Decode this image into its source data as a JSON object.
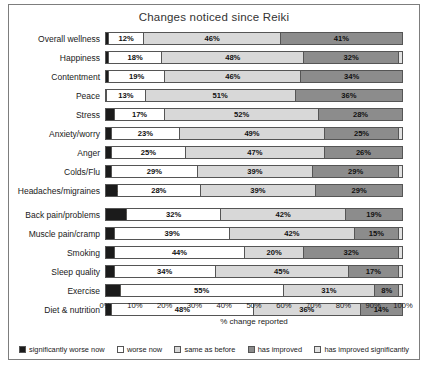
{
  "chart_data": {
    "type": "bar",
    "orientation": "horizontal",
    "stacked": true,
    "title": "Changes noticed since Reiki",
    "xlabel": "% change reported",
    "ylabel": "",
    "xlim": [
      0,
      100
    ],
    "xticks": [
      "0%",
      "10%",
      "20%",
      "30%",
      "40%",
      "50%",
      "60%",
      "70%",
      "80%",
      "90%",
      "100%"
    ],
    "grid": false,
    "legend_position": "bottom",
    "categories": [
      "Overall wellness",
      "Happiness",
      "Contentment",
      "Peace",
      "Stress",
      "Anxiety/worry",
      "Anger",
      "Colds/Flu",
      "Headaches/migraines",
      "Back pain/problems",
      "Muscle pain/cramp",
      "Smoking",
      "Sleep quality",
      "Exercise",
      "Diet & nutrition"
    ],
    "group_breaks_after": [
      "Headaches/migraines"
    ],
    "series": [
      {
        "name": "significantly worse now",
        "color": "#1b1b1b",
        "values": [
          1,
          1,
          1,
          0.4,
          3,
          2,
          2,
          2,
          4,
          7,
          3,
          3,
          3,
          5,
          2
        ],
        "labels": [
          "1%",
          "1%",
          "1%",
          "0.4%",
          "3%",
          "2%",
          "2%",
          "2%",
          "4%",
          "7%",
          "3%",
          "3%",
          "3%",
          "5%",
          "2%"
        ]
      },
      {
        "name": "worse now",
        "color": "#ffffff",
        "values": [
          12,
          18,
          19,
          13,
          17,
          23,
          25,
          29,
          28,
          32,
          39,
          44,
          34,
          55,
          48
        ],
        "labels": [
          "12%",
          "18%",
          "19%",
          "13%",
          "17%",
          "23%",
          "25%",
          "29%",
          "28%",
          "32%",
          "39%",
          "44%",
          "34%",
          "55%",
          "48%"
        ]
      },
      {
        "name": "same as before",
        "color": "#d8d8d8",
        "values": [
          46,
          48,
          46,
          51,
          52,
          49,
          47,
          39,
          39,
          42,
          42,
          20,
          45,
          31,
          36
        ],
        "labels": [
          "46%",
          "48%",
          "46%",
          "51%",
          "52%",
          "49%",
          "47%",
          "39%",
          "39%",
          "42%",
          "42%",
          "20%",
          "45%",
          "31%",
          "36%"
        ]
      },
      {
        "name": "has improved",
        "color": "#8c8c8c",
        "values": [
          41,
          32,
          34,
          36,
          28,
          25,
          26,
          29,
          29,
          19,
          15,
          32,
          17,
          8,
          14
        ],
        "labels": [
          "41%",
          "32%",
          "34%",
          "36%",
          "28%",
          "25%",
          "26%",
          "29%",
          "29%",
          "19%",
          "15%",
          "32%",
          "17%",
          "8%",
          "14%"
        ]
      },
      {
        "name": "has improved significantly",
        "color": "#e2e2e2",
        "values": [
          0,
          1,
          0,
          0,
          0,
          1,
          0,
          1,
          0,
          0,
          1,
          1,
          1,
          1,
          0
        ],
        "labels": [
          "",
          "",
          "",
          "",
          "",
          "",
          "",
          "",
          "",
          "",
          "",
          "",
          "",
          "",
          ""
        ]
      }
    ]
  },
  "legend": [
    {
      "label": "significantly worse now",
      "color": "#1b1b1b"
    },
    {
      "label": "worse now",
      "color": "#ffffff"
    },
    {
      "label": "same as before",
      "color": "#d8d8d8"
    },
    {
      "label": "has improved",
      "color": "#8c8c8c"
    },
    {
      "label": "has improved significantly",
      "color": "#e2e2e2"
    }
  ]
}
